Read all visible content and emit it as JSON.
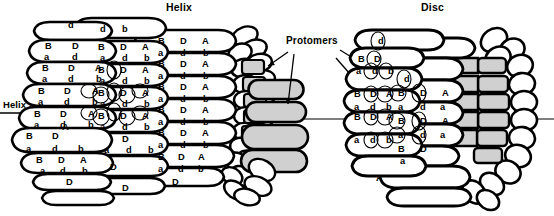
{
  "figure": {
    "titles": {
      "helix": "Helix",
      "disc": "Disc"
    },
    "annotations": {
      "protomers": "Protomers",
      "helix_axis": "Helix axis"
    },
    "colors": {
      "background": "#ffffff",
      "outline": "#000000",
      "shaded_subunit": "#d0d0d0",
      "face_fill": "#ffffff"
    },
    "subunit_labels": {
      "upper_row": [
        "B",
        "D",
        "A"
      ],
      "lower_row": [
        "a",
        "d",
        "b"
      ],
      "all": [
        "B",
        "D",
        "A",
        "a",
        "d",
        "b"
      ]
    },
    "helix": {
      "label": "Helix",
      "axis_label": "Helix axis",
      "stacks": [
        {
          "name": "left-front-stack",
          "rows": [
            {
              "top": [
                "",
                "d",
                ""
              ],
              "bottom": [
                "",
                "",
                ""
              ]
            },
            {
              "top": [
                "B",
                "D",
                ""
              ],
              "bottom": [
                "a",
                "d",
                ""
              ]
            },
            {
              "top": [
                "B",
                "D",
                "A"
              ],
              "bottom": [
                "a",
                "d",
                "b"
              ]
            },
            {
              "top": [
                "B",
                "D",
                "A"
              ],
              "bottom": [
                "a",
                "d",
                "b"
              ]
            },
            {
              "top": [
                "B",
                "D",
                "A"
              ],
              "bottom": [
                "a",
                "d",
                "b"
              ]
            },
            {
              "top": [
                "B",
                "D",
                "A"
              ],
              "bottom": [
                "a",
                "d",
                "b"
              ]
            },
            {
              "top": [
                "B",
                "D",
                "A"
              ],
              "bottom": [
                "a",
                "d",
                "b"
              ]
            },
            {
              "top": [
                "",
                "D",
                ""
              ],
              "bottom": [
                "",
                "",
                ""
              ]
            }
          ]
        },
        {
          "name": "middle-stack",
          "rows": [
            {
              "top": [
                "",
                "d",
                "b"
              ],
              "bottom": [
                "B",
                "D",
                "A"
              ]
            },
            {
              "top": [
                "a",
                "d",
                "b"
              ],
              "bottom": [
                "B",
                "D",
                "A"
              ]
            },
            {
              "top": [
                "a",
                "d",
                "b"
              ],
              "bottom": [
                "B",
                "D",
                "A"
              ]
            },
            {
              "top": [
                "a",
                "d",
                "b"
              ],
              "bottom": [
                "B",
                "D",
                "A"
              ]
            },
            {
              "top": [
                "a",
                "d",
                "b"
              ],
              "bottom": [
                "B",
                "D",
                "A"
              ]
            },
            {
              "top": [
                "a",
                "d",
                "b"
              ],
              "bottom": [
                "",
                "D",
                ""
              ]
            }
          ]
        },
        {
          "name": "right-front-stack",
          "rows": [
            {
              "top": [
                "B",
                "D",
                "A"
              ],
              "bottom": [
                "a",
                "d",
                "b"
              ]
            },
            {
              "top": [
                "B",
                "D",
                "A"
              ],
              "bottom": [
                "a",
                "d",
                "b"
              ]
            },
            {
              "top": [
                "B",
                "D",
                "A"
              ],
              "bottom": [
                "a",
                "d",
                "b"
              ]
            },
            {
              "top": [
                "B",
                "D",
                "A"
              ],
              "bottom": [
                "a",
                "d",
                "b"
              ]
            },
            {
              "top": [
                "B",
                "D",
                "A"
              ],
              "bottom": [
                "a",
                "d",
                "b"
              ]
            },
            {
              "top": [
                "B",
                "D",
                "A"
              ],
              "bottom": [
                "a",
                "d",
                "b"
              ]
            }
          ]
        }
      ],
      "circled_protomer_labels": [
        "b",
        "B",
        "D",
        "A",
        "a",
        "d"
      ]
    },
    "disc": {
      "label": "Disc",
      "stacks": [
        {
          "name": "disc-left-stack",
          "rows": [
            {
              "top": [
                "",
                "d",
                ""
              ],
              "bottom": [
                "",
                "",
                ""
              ]
            },
            {
              "top": [
                "B",
                "D",
                ""
              ],
              "bottom": [
                "a",
                "d",
                "b"
              ]
            },
            {
              "top": [
                "B",
                "D",
                "A"
              ],
              "bottom": [
                "a",
                "d",
                "b"
              ]
            },
            {
              "top": [
                "B",
                "D",
                "A"
              ],
              "bottom": [
                "a",
                "d",
                "b"
              ]
            }
          ]
        },
        {
          "name": "disc-right-stack",
          "rows": [
            {
              "top": [
                "",
                "d",
                ""
              ],
              "bottom": [
                "B",
                "D",
                "A"
              ]
            },
            {
              "top": [
                "a",
                "d",
                "a"
              ],
              "bottom": [
                "B",
                "D",
                "A"
              ]
            },
            {
              "top": [
                "a",
                "d",
                "a"
              ],
              "bottom": [
                "B",
                "D",
                ""
              ]
            },
            {
              "top": [
                "",
                "a",
                ""
              ],
              "bottom": [
                "",
                "A",
                ""
              ]
            }
          ]
        }
      ]
    },
    "arrows": {
      "count": 4,
      "from": "Protomers",
      "targets": [
        "helix-shaded-column",
        "helix-shaded-protomer",
        "disc-upper-protomer",
        "disc-lower-protomer"
      ]
    }
  }
}
